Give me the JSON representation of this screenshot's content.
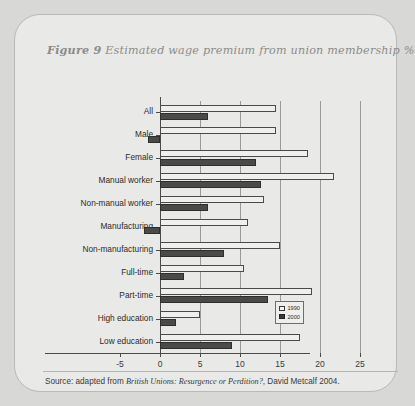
{
  "figure": {
    "label": "Figure 9",
    "title": "Estimated wage premium from union membership %",
    "source": "Source: adapted from ",
    "source_italic": "British Unions: Resurgence or Perdition?",
    "source_tail": ", David Metcalf 2004."
  },
  "legend": {
    "position": "bottom-right",
    "items": [
      {
        "label": "1990",
        "color": "#f4f4f2"
      },
      {
        "label": "2000",
        "color": "#39393a"
      }
    ]
  },
  "chart_data": {
    "type": "bar",
    "orientation": "horizontal",
    "title": "Estimated wage premium from union membership %",
    "xlabel": "",
    "ylabel": "",
    "xlim": [
      -5,
      25
    ],
    "xticks": [
      -5,
      0,
      5,
      10,
      15,
      20,
      25
    ],
    "grid": true,
    "categories": [
      "All",
      "Male",
      "Female",
      "Manual worker",
      "Non-manual worker",
      "Manufacturing",
      "Non-manufacturing",
      "Full-time",
      "Part-time",
      "High education",
      "Low education"
    ],
    "series": [
      {
        "name": "1990",
        "color": "#f4f4f2",
        "values": [
          14.5,
          14.5,
          18.5,
          21.8,
          13.0,
          11.0,
          15.0,
          10.5,
          19.0,
          5.0,
          17.5
        ]
      },
      {
        "name": "2000",
        "color": "#39393a",
        "values": [
          6.0,
          -1.5,
          12.0,
          12.6,
          6.0,
          -2.0,
          8.0,
          3.0,
          13.5,
          2.0,
          9.0
        ]
      }
    ]
  }
}
